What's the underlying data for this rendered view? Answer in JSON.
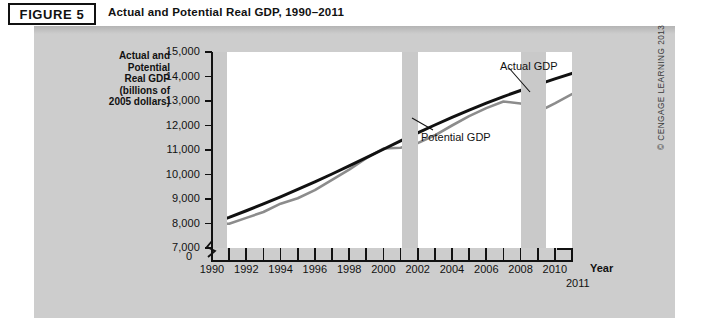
{
  "figure": {
    "badge": "FIGURE 5",
    "title": "Actual and Potential Real GDP, 1990–2011",
    "copyright": "© CENGAGE LEARNING 2013"
  },
  "axis_title_lines": [
    "Actual and",
    "Potential",
    "Real GDP",
    "(billions of",
    "2005 dollars)"
  ],
  "labels": {
    "zero": "0",
    "x_axis_name": "Year",
    "end_year": "2011"
  },
  "colors": {
    "potential_line": "#111111",
    "actual_line": "#8c8c8c",
    "recession_band": "#c9c9c9",
    "panel_background": "#cdcdcd",
    "plot_background": "#ffffff"
  },
  "chart_data": {
    "type": "line",
    "title": "Actual and Potential Real GDP, 1990–2011",
    "xlabel": "Year",
    "ylabel": "Actual and Potential Real GDP (billions of 2005 dollars)",
    "xlim": [
      1990,
      2011
    ],
    "ylim": [
      7000,
      15000
    ],
    "y_axis_broken_at": 0,
    "ytick_labels": [
      "0",
      "7,000",
      "8,000",
      "9,000",
      "10,000",
      "11,000",
      "12,000",
      "13,000",
      "14,000",
      "15,000"
    ],
    "yticks": [
      7000,
      8000,
      9000,
      10000,
      11000,
      12000,
      13000,
      14000,
      15000
    ],
    "xticks": [
      1990,
      1991,
      1992,
      1993,
      1994,
      1995,
      1996,
      1997,
      1998,
      1999,
      2000,
      2001,
      2002,
      2003,
      2004,
      2005,
      2006,
      2007,
      2008,
      2009,
      2010,
      2011
    ],
    "xtick_labels": [
      "1990",
      "",
      "1992",
      "",
      "1994",
      "",
      "1996",
      "",
      "1998",
      "",
      "2000",
      "",
      "2002",
      "",
      "2004",
      "",
      "2006",
      "",
      "2008",
      "",
      "2010",
      ""
    ],
    "grid": false,
    "legend": "annotations",
    "x": [
      1990,
      1991,
      1992,
      1993,
      1994,
      1995,
      1996,
      1997,
      1998,
      1999,
      2000,
      2001,
      2002,
      2003,
      2004,
      2005,
      2006,
      2007,
      2008,
      2009,
      2010,
      2011
    ],
    "series": [
      {
        "name": "Potential GDP",
        "color": "#111111",
        "values": [
          8000,
          8250,
          8520,
          8800,
          9090,
          9390,
          9700,
          10020,
          10350,
          10690,
          11030,
          11370,
          11700,
          12020,
          12330,
          12630,
          12910,
          13180,
          13430,
          13670,
          13900,
          14130
        ]
      },
      {
        "name": "Actual GDP",
        "color": "#8c8c8c",
        "values": [
          8000,
          7990,
          8230,
          8470,
          8810,
          9030,
          9360,
          9780,
          10200,
          10670,
          11060,
          11090,
          11280,
          11600,
          12000,
          12380,
          12710,
          12980,
          12900,
          12550,
          12900,
          13280
        ]
      }
    ],
    "annotations": [
      {
        "text": "Actual GDP",
        "points_to": "Actual GDP line",
        "x": 2007.6
      },
      {
        "text": "Potential GDP",
        "points_to": "Potential GDP line",
        "x": 2002.9
      }
    ],
    "recession_bands": [
      {
        "label": "1990–91 recession",
        "start": 1990.0,
        "end": 1990.9
      },
      {
        "label": "2001 recession",
        "start": 2001.1,
        "end": 2002.0
      },
      {
        "label": "2007–09 recession",
        "start": 2008.0,
        "end": 2009.5
      }
    ]
  }
}
